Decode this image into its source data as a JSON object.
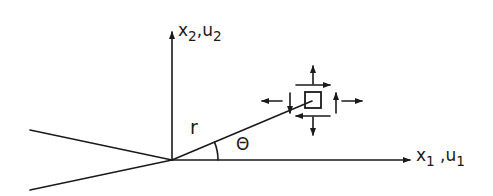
{
  "diagram": {
    "colors": {
      "stroke": "#1a1a1a",
      "background": "#ffffff"
    },
    "labels": {
      "vertical_axis": {
        "var": "x",
        "sub": "2",
        "sep": ",",
        "var2": "u",
        "sub2": "2"
      },
      "horizontal_axis": {
        "var": "x",
        "sub": "1",
        "sep": " ,",
        "var2": "u",
        "sub2": "1"
      },
      "radius": "r",
      "angle": "Θ"
    },
    "elements": {
      "origin": "crack-tip",
      "crack_faces": [
        "upper-crack-face",
        "lower-crack-face"
      ],
      "stress_element": "square element with normal and shear stress arrows"
    }
  }
}
